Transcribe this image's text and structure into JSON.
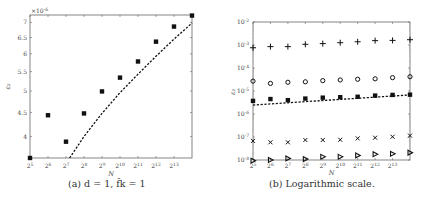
{
  "chart_data": [
    {
      "type": "scatter",
      "panel": "a",
      "title": "",
      "caption": "(a) d = 1, f̂k = 1",
      "xlabel": "N",
      "ylabel": "ε₂",
      "x_scale": "log2",
      "y_scale": "log",
      "y_multiplier": "×10^-6",
      "x_ticks": [
        "2^5",
        "2^6",
        "2^7",
        "2^8",
        "2^9",
        "2^10",
        "2^11",
        "2^12",
        "2^13"
      ],
      "y_ticks": [
        4,
        4.5,
        5,
        5.5,
        6,
        6.5,
        7
      ],
      "xlim_exp": [
        5,
        14
      ],
      "ylim": [
        3.6,
        7.26
      ],
      "grid": false,
      "series": [
        {
          "name": "measured",
          "marker": "filled-square",
          "x_exp": [
            5,
            6,
            7,
            8,
            9,
            10,
            11,
            12,
            13,
            14
          ],
          "values": [
            3.6,
            4.44,
            3.9,
            4.48,
            4.99,
            5.34,
            5.78,
            6.37,
            6.86,
            7.24
          ]
        },
        {
          "name": "fit",
          "style": "dashed-line",
          "x_exp": [
            7.2,
            8,
            9,
            10,
            11,
            12,
            13,
            14
          ],
          "values": [
            3.6,
            4.0,
            4.48,
            4.96,
            5.43,
            5.93,
            6.45,
            6.98
          ]
        }
      ]
    },
    {
      "type": "scatter",
      "panel": "b",
      "caption": "(b) Logarithmic scale.",
      "xlabel": "N",
      "ylabel": "ε₂",
      "x_scale": "log2",
      "y_scale": "log",
      "x_ticks": [
        "2^5",
        "2^6",
        "2^7",
        "2^8",
        "2^9",
        "2^10",
        "2^11",
        "2^12",
        "2^13"
      ],
      "y_ticks": [
        "10^-8",
        "10^-7",
        "10^-6",
        "10^-5",
        "10^-4",
        "10^-3",
        "10^-2"
      ],
      "xlim_exp": [
        5,
        14
      ],
      "ylim_log10": [
        -8,
        -2
      ],
      "grid": false,
      "series": [
        {
          "name": "plus",
          "marker": "+",
          "x_exp": [
            5,
            6,
            7,
            8,
            9,
            10,
            11,
            12,
            13,
            14
          ],
          "log10_values": [
            -3.12,
            -3.07,
            -3.07,
            -2.97,
            -2.94,
            -2.9,
            -2.86,
            -2.81,
            -2.8,
            -2.77
          ]
        },
        {
          "name": "circle",
          "marker": "o",
          "x_exp": [
            5,
            6,
            7,
            8,
            9,
            10,
            11,
            12,
            13,
            14
          ],
          "log10_values": [
            -4.57,
            -4.67,
            -4.62,
            -4.6,
            -4.55,
            -4.52,
            -4.49,
            -4.47,
            -4.42,
            -4.38
          ]
        },
        {
          "name": "square",
          "marker": "filled-square",
          "x_exp": [
            5,
            6,
            7,
            8,
            9,
            10,
            11,
            12,
            13,
            14
          ],
          "log10_values": [
            -5.43,
            -5.35,
            -5.4,
            -5.33,
            -5.29,
            -5.27,
            -5.25,
            -5.2,
            -5.17,
            -5.16
          ]
        },
        {
          "name": "fit",
          "style": "dashed-line",
          "x_exp": [
            5,
            14
          ],
          "log10_values": [
            -5.61,
            -5.17
          ]
        },
        {
          "name": "cross",
          "marker": "x",
          "x_exp": [
            5,
            6,
            7,
            8,
            9,
            10,
            11,
            12,
            13,
            14
          ],
          "log10_values": [
            -7.17,
            -7.23,
            -7.23,
            -7.13,
            -7.13,
            -7.12,
            -7.06,
            -7.03,
            -6.99,
            -6.94
          ]
        },
        {
          "name": "triangle",
          "marker": "triangle-right",
          "x_exp": [
            5,
            6,
            7,
            8,
            9,
            10,
            11,
            12,
            13,
            14
          ],
          "log10_values": [
            -8.03,
            -8.0,
            -7.93,
            -7.96,
            -7.86,
            -7.86,
            -7.8,
            -7.75,
            -7.73,
            -7.68
          ]
        }
      ]
    }
  ],
  "panel_a": {
    "caption": "(a) d = 1, f̂k = 1",
    "xlabel": "N",
    "ylabel": "ε₂",
    "multiplier": "×10",
    "multiplier_exp": "-6"
  },
  "panel_b": {
    "caption": "(b) Logarithmic scale.",
    "xlabel": "N",
    "ylabel": "ε₂"
  }
}
